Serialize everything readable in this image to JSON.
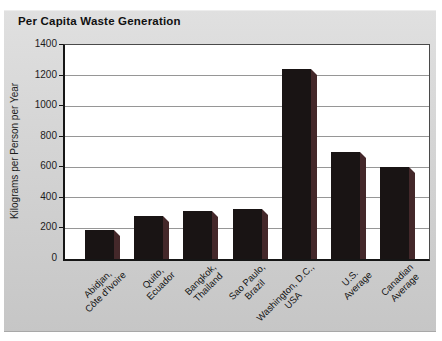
{
  "figure": {
    "outer_background": "#ffffff",
    "panel_background_top": "#e0e0e0",
    "panel_background_bottom": "#c6c6c6"
  },
  "chart_data": {
    "type": "bar",
    "title": "Per Capita Waste Generation",
    "xlabel": "",
    "ylabel": "Kilograms per Person per Year",
    "ylim": [
      0,
      1400
    ],
    "ytick_step": 200,
    "ytick_labels": [
      "0",
      "200",
      "400",
      "600",
      "800",
      "1000",
      "1200",
      "1400"
    ],
    "grid": "horizontal",
    "legend": "none",
    "categories": [
      "Abidjan, Côte d'Ivoire",
      "Quito, Ecuador",
      "Bangkok, Thailand",
      "Sao Paulo, Brazil",
      "Washington, D.C., USA",
      "U.S. Average",
      "Canadian Average"
    ],
    "category_lines": [
      [
        "Abidjan,",
        "Côte d'Ivoire"
      ],
      [
        "Quito,",
        "Ecuador"
      ],
      [
        "Bangkok,",
        "Thailand"
      ],
      [
        "Sao Paulo,",
        "Brazil"
      ],
      [
        "Washington, D.C.,",
        "USA"
      ],
      [
        "U.S.",
        "Average"
      ],
      [
        "Canadian",
        "Average"
      ]
    ],
    "values": [
      190,
      280,
      315,
      330,
      1240,
      700,
      600
    ],
    "units": "kilograms per person per year",
    "colors": {
      "bar_front": "#191414",
      "bar_side": "#44282a",
      "gridline": "#969696",
      "axis": "#161616",
      "plot_background": "#ffffff",
      "text": "#1c1c1c"
    }
  }
}
